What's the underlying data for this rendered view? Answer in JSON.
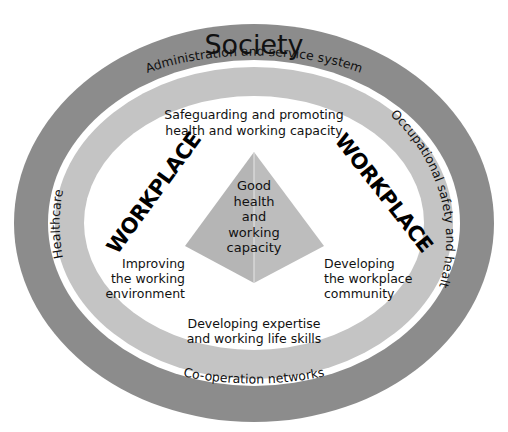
{
  "diagram": {
    "outer_ring": {
      "label": "Society",
      "color": "#8c8c8c"
    },
    "middle_ring": {
      "color": "#c4c4c4",
      "segments": {
        "top": "Administration and service system",
        "right": "Occupational safety and health",
        "bottom": "Co-operation networks",
        "left": "Healthcare"
      }
    },
    "inner_area": {
      "workplace_label_left": "WORKPLACE",
      "workplace_label_right": "WORKPLACE",
      "top_text": [
        "Safeguarding and promoting",
        "health and working capacity"
      ],
      "left_text": [
        "Improving",
        "the working",
        "environment"
      ],
      "right_text": [
        "Developing",
        "the workplace",
        "community"
      ],
      "bottom_text": [
        "Developing expertise",
        "and working life skills"
      ]
    },
    "pyramid": {
      "color_left": "#b5b5b5",
      "color_right": "#c0c0c0",
      "label": [
        "Good",
        "health",
        "and",
        "working",
        "capacity"
      ]
    }
  }
}
